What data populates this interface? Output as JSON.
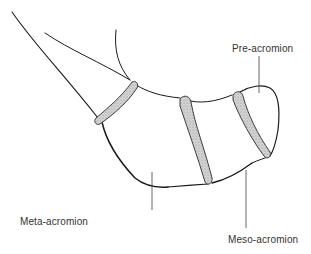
{
  "figure": {
    "labels": {
      "pre_acromion": "Pre-acromion",
      "meso_acromion": "Meso-acromion",
      "meta_acromion": "Meta-acromion"
    },
    "colors": {
      "outline": "#1a1a1a",
      "leader_line": "#555555",
      "suture_fill": "#cfcfcf",
      "label_text": "#333333",
      "background": "#ffffff"
    }
  }
}
